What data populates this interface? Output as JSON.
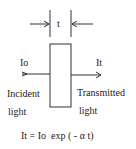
{
  "diagram": {
    "thickness_label": "t",
    "incident_intensity": "Io",
    "transmitted_intensity": "It",
    "incident_label_line1": "Incident",
    "incident_label_line2": "light",
    "transmitted_label_line1": "Transmitted",
    "transmitted_label_line2": "light",
    "equation": "It = Io  exp ( - α t)",
    "colors": {
      "line": "#333333",
      "background": "#ffffff"
    }
  }
}
